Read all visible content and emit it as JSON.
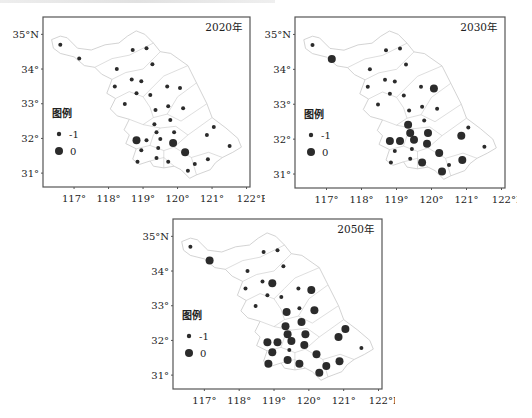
{
  "figure": {
    "top_cropped_text_visible": true,
    "panels": [
      {
        "id": "p2020",
        "title": "2020年",
        "frame": {
          "x": 43,
          "y": 17,
          "w": 207,
          "h": 170
        }
      },
      {
        "id": "p2030",
        "title": "2030年",
        "frame": {
          "x": 295,
          "y": 17,
          "w": 210,
          "h": 171
        }
      },
      {
        "id": "p2050",
        "title": "2050年",
        "frame": {
          "x": 173,
          "y": 219,
          "w": 209,
          "h": 170
        }
      }
    ],
    "axes": {
      "x_ticks": [
        "117°",
        "118°",
        "119°",
        "120°",
        "121°",
        "122°E"
      ],
      "x_values": [
        117,
        118,
        119,
        120,
        121,
        122
      ],
      "y_ticks": [
        "35°N",
        "34°",
        "33°",
        "32°",
        "31°"
      ],
      "y_values": [
        35,
        34,
        33,
        32,
        31
      ],
      "lon_range": [
        116.1,
        122.1
      ],
      "lat_range": [
        30.6,
        35.5
      ]
    },
    "legend": {
      "title": "图例",
      "items": [
        {
          "label": "-1",
          "symbol": "small-dot"
        },
        {
          "label": "0",
          "symbol": "large-dot"
        }
      ]
    },
    "colors": {
      "dot": "#2b2b2b",
      "frame": "#555555",
      "boundary": "#c8c8c8"
    }
  },
  "chart_data": {
    "type": "scatter",
    "xlabel": "Longitude (°E)",
    "ylabel": "Latitude (°N)",
    "legend": [
      "-1",
      "0"
    ],
    "stations": [
      [
        116.6,
        34.7
      ],
      [
        117.15,
        34.3
      ],
      [
        118.7,
        34.55
      ],
      [
        119.1,
        34.6
      ],
      [
        119.27,
        34.14
      ],
      [
        118.24,
        34.0
      ],
      [
        118.67,
        33.7
      ],
      [
        118.95,
        33.65
      ],
      [
        118.18,
        33.5
      ],
      [
        118.81,
        33.3
      ],
      [
        119.21,
        33.25
      ],
      [
        119.7,
        33.5
      ],
      [
        120.07,
        33.45
      ],
      [
        118.47,
        32.99
      ],
      [
        119.36,
        32.82
      ],
      [
        119.73,
        32.93
      ],
      [
        120.16,
        32.87
      ],
      [
        119.79,
        32.53
      ],
      [
        119.33,
        32.41
      ],
      [
        119.39,
        32.18
      ],
      [
        119.9,
        32.18
      ],
      [
        121.05,
        32.33
      ],
      [
        120.85,
        32.1
      ],
      [
        118.81,
        31.95
      ],
      [
        119.1,
        31.95
      ],
      [
        119.5,
        31.98
      ],
      [
        119.87,
        31.87
      ],
      [
        118.95,
        31.66
      ],
      [
        119.44,
        31.72
      ],
      [
        120.22,
        31.6
      ],
      [
        121.51,
        31.78
      ],
      [
        118.84,
        31.33
      ],
      [
        119.39,
        31.44
      ],
      [
        119.73,
        31.33
      ],
      [
        120.5,
        31.26
      ],
      [
        120.88,
        31.4
      ],
      [
        120.3,
        31.07
      ]
    ],
    "series": [
      {
        "name": "2020年",
        "values": [
          -1,
          -1,
          -1,
          -1,
          -1,
          -1,
          -1,
          -1,
          -1,
          -1,
          -1,
          -1,
          -1,
          -1,
          -1,
          -1,
          -1,
          -1,
          -1,
          -1,
          -1,
          -1,
          -1,
          0,
          -1,
          -1,
          0,
          -1,
          -1,
          0,
          -1,
          -1,
          -1,
          -1,
          -1,
          -1,
          -1
        ]
      },
      {
        "name": "2030年",
        "values": [
          -1,
          0,
          -1,
          -1,
          -1,
          -1,
          -1,
          -1,
          -1,
          -1,
          -1,
          -1,
          0,
          -1,
          -1,
          -1,
          -1,
          -1,
          0,
          0,
          0,
          -1,
          0,
          0,
          0,
          0,
          0,
          -1,
          -1,
          0,
          -1,
          -1,
          -1,
          0,
          -1,
          0,
          0
        ]
      },
      {
        "name": "2050年",
        "values": [
          -1,
          0,
          -1,
          -1,
          -1,
          -1,
          -1,
          0,
          -1,
          -1,
          -1,
          -1,
          0,
          -1,
          0,
          -1,
          0,
          0,
          0,
          0,
          0,
          0,
          0,
          0,
          0,
          0,
          0,
          0,
          -1,
          0,
          -1,
          0,
          0,
          0,
          0,
          0,
          0
        ]
      }
    ],
    "x_ticks": [
      117,
      118,
      119,
      120,
      121,
      122
    ],
    "y_ticks": [
      31,
      32,
      33,
      34,
      35
    ],
    "grid": false,
    "legend_position": "lower-left inside"
  }
}
